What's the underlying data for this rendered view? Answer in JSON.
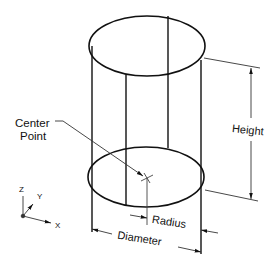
{
  "diagram": {
    "labels": {
      "center_line1": "Center",
      "center_line2": "Point",
      "height": "Height",
      "radius": "Radius",
      "diameter": "Diameter"
    },
    "axes": {
      "x": "X",
      "y": "Y",
      "z": "Z"
    },
    "colors": {
      "stroke": "#111111",
      "thin": "#444444",
      "background": "#ffffff"
    }
  }
}
